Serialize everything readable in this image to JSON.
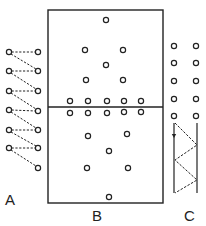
{
  "diagram": {
    "stroke_color": "#222222",
    "background": "#ffffff",
    "labels": {
      "a": "A",
      "b": "B",
      "c": "C"
    },
    "panel_a": {
      "left_column_x": 9,
      "right_column_x": 38,
      "left_circles_y": [
        52,
        71,
        91,
        110,
        130,
        148
      ],
      "right_circles_y": [
        52,
        71,
        91,
        111,
        130,
        148,
        168
      ],
      "connections": "dashed horizontal pairs and dashed diagonals from each left circle to the next lower right circle"
    },
    "panel_b": {
      "rect": {
        "x": 48,
        "y": 10,
        "width": 115,
        "height": 193
      },
      "center_line_y": 107,
      "upper_circles": [
        [
          106,
          20
        ],
        [
          85,
          50
        ],
        [
          123,
          50
        ],
        [
          106,
          65
        ],
        [
          86,
          80
        ],
        [
          123,
          80
        ]
      ],
      "row_above_line": [
        [
          70,
          101
        ],
        [
          88,
          101
        ],
        [
          107,
          101
        ],
        [
          124,
          101
        ],
        [
          141,
          101
        ]
      ],
      "row_below_line": [
        [
          70,
          113
        ],
        [
          88,
          113
        ],
        [
          107,
          113
        ],
        [
          124,
          112
        ],
        [
          141,
          112
        ]
      ],
      "lower_circles": [
        [
          88,
          136
        ],
        [
          127,
          134
        ],
        [
          109,
          151
        ],
        [
          87,
          168
        ],
        [
          128,
          168
        ],
        [
          109,
          197
        ]
      ]
    },
    "panel_c": {
      "circle_columns_x": [
        174,
        196
      ],
      "circle_rows_y": [
        46,
        63,
        81,
        99,
        116
      ],
      "left_rail_x": 174,
      "right_rail_x": 197,
      "rail_top_y": 123,
      "rail_bottom_y": 193,
      "zigzag_points": [
        [
          175,
          123
        ],
        [
          197,
          145
        ],
        [
          175,
          160
        ],
        [
          197,
          180
        ],
        [
          175,
          193
        ]
      ],
      "arrow_y": 137
    }
  }
}
